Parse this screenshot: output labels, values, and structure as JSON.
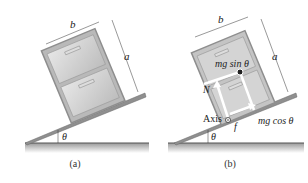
{
  "panels": [
    {
      "id": "a",
      "caption": "(a)",
      "labels": {
        "width": "b",
        "height": "a",
        "angle": "θ"
      }
    },
    {
      "id": "b",
      "caption": "(b)",
      "labels": {
        "width": "b",
        "height": "a",
        "angle": "θ",
        "weight_parallel": "mg sin θ",
        "weight_perpendicular": "mg cos θ",
        "normal": "N",
        "friction": "f",
        "axis": "Axis"
      }
    }
  ],
  "colors": {
    "cabinet": "#b9b9b9",
    "cabinet_frame": "#8e8e8e",
    "ramp": "#8f8f8f",
    "ground": "#555555",
    "arrow": "#ffffff"
  }
}
